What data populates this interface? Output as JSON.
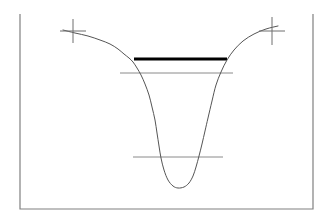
{
  "figure": {
    "type": "line-profile-diagram",
    "background_color": "#ffffff",
    "width": 333,
    "height": 223
  },
  "frame": {
    "name": "plot-frame",
    "style": "open-top-box",
    "color": "#808080",
    "stroke_width": 1.2,
    "left_x": 20,
    "right_x": 313,
    "top_y": 14,
    "bottom_y": 209,
    "top_border_visible": false
  },
  "chart_data": {
    "type": "line",
    "subtitle": "",
    "xlabel": "",
    "ylabel": "",
    "xlim": [
      20,
      313
    ],
    "ylim": [
      209,
      14
    ],
    "grid": false,
    "legend_position": "none",
    "note": "Inverted flux profile: flat continuum on both wings dropping into a deep broad saturated absorption trough; three horizontal level markers and two cross ticks on the continuum.",
    "series": [
      {
        "name": "flux-profile",
        "color": "#555555",
        "stroke_width": 1.0,
        "x": [
          63,
          75,
          88,
          100,
          110,
          118,
          124,
          129,
          133,
          137,
          141,
          145,
          149,
          152,
          155,
          157,
          159,
          161,
          164,
          168,
          173,
          178,
          184,
          189,
          193,
          196,
          199,
          202,
          205,
          208,
          212,
          216,
          221,
          227,
          234,
          243,
          254,
          266,
          278
        ],
        "y": [
          30,
          33,
          36,
          40,
          44,
          49,
          54,
          58,
          62,
          68,
          75,
          84,
          95,
          107,
          120,
          133,
          146,
          158,
          170,
          180,
          186,
          188,
          187,
          183,
          176,
          167,
          156,
          144,
          131,
          118,
          101,
          85,
          72,
          60,
          50,
          41,
          34,
          29,
          26
        ]
      }
    ],
    "level_markers": [
      {
        "name": "continuum-level-thick",
        "label": "continuum level",
        "x_start": 134,
        "x_end": 227,
        "y": 59,
        "color": "#000000",
        "stroke_width": 3.2,
        "emphasis": "thick"
      },
      {
        "name": "upper-depth-level",
        "label": "upper depth level",
        "x_start": 120,
        "x_end": 233,
        "y": 73,
        "color": "#8a8a8a",
        "stroke_width": 1.0,
        "emphasis": "thin"
      },
      {
        "name": "lower-depth-level",
        "label": "lower depth level",
        "x_start": 133,
        "x_end": 223,
        "y": 157,
        "color": "#8a8a8a",
        "stroke_width": 1.0,
        "emphasis": "thin"
      }
    ],
    "cross_markers": [
      {
        "name": "left-continuum-cross",
        "cx": 73,
        "cy": 31,
        "half_width": 13,
        "top_y": 19,
        "bottom_y": 43,
        "color": "#6e6e6e",
        "stroke_width": 1.0
      },
      {
        "name": "right-continuum-cross",
        "cx": 272,
        "cy": 31,
        "half_width": 13,
        "top_y": 17,
        "bottom_y": 45,
        "color": "#6e6e6e",
        "stroke_width": 1.0
      }
    ]
  },
  "colors": {
    "curve": "#555555",
    "thick_level": "#000000",
    "thin_level": "#8a8a8a",
    "marker": "#6e6e6e",
    "frame": "#808080",
    "background": "#ffffff"
  }
}
